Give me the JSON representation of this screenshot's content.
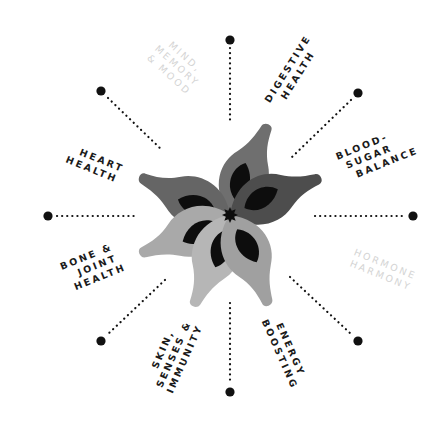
{
  "diagram": {
    "center": {
      "x": 230,
      "y": 215
    },
    "colors": {
      "background": "#ffffff",
      "spoke_dot": "#111111",
      "label_active": "#1a1a1a",
      "label_faded": "#d4d4d4",
      "petal_inner": "#0d0d0d",
      "center_star": "#0d0d0d"
    },
    "petals": [
      {
        "name": "petal-upper",
        "angle": -67,
        "color": "#6f6f6f"
      },
      {
        "name": "petal-right",
        "angle": -22,
        "color": "#4d4d4d"
      },
      {
        "name": "petal-upper-left",
        "angle": -157,
        "color": "#656565"
      },
      {
        "name": "petal-lower-left",
        "angle": 157,
        "color": "#a9a9a9"
      },
      {
        "name": "petal-lower",
        "angle": 112,
        "color": "#b6b6b6"
      },
      {
        "name": "petal-lower-right",
        "angle": 67,
        "color": "#a0a0a0"
      }
    ],
    "spokes": [
      {
        "name": "spoke-top",
        "x1": 230,
        "y1": 48,
        "x2": 230,
        "y2": 122,
        "dot_x": 230,
        "dot_y": 40
      },
      {
        "name": "spoke-top-right",
        "x1": 351,
        "y1": 100,
        "x2": 292,
        "y2": 157,
        "dot_x": 358,
        "dot_y": 93
      },
      {
        "name": "spoke-right",
        "x1": 315,
        "y1": 216,
        "x2": 405,
        "y2": 216,
        "dot_x": 413,
        "dot_y": 216
      },
      {
        "name": "spoke-bottom-right",
        "x1": 290,
        "y1": 277,
        "x2": 351,
        "y2": 334,
        "dot_x": 358,
        "dot_y": 341
      },
      {
        "name": "spoke-bottom",
        "x1": 230,
        "y1": 303,
        "x2": 230,
        "y2": 384,
        "dot_x": 230,
        "dot_y": 392
      },
      {
        "name": "spoke-bottom-left",
        "x1": 165,
        "y1": 280,
        "x2": 108,
        "y2": 334,
        "dot_x": 101,
        "dot_y": 341
      },
      {
        "name": "spoke-left",
        "x1": 57,
        "y1": 216,
        "x2": 136,
        "y2": 216,
        "dot_x": 48,
        "dot_y": 216
      },
      {
        "name": "spoke-top-left",
        "x1": 108,
        "y1": 98,
        "x2": 163,
        "y2": 151,
        "dot_x": 101,
        "dot_y": 91
      }
    ],
    "labels": [
      {
        "name": "label-mind-memory-mood",
        "lines": [
          "MIND,",
          "MEMORY",
          "& MOOD"
        ],
        "faded": true
      },
      {
        "name": "label-digestive-health",
        "lines": [
          "DIGESTIVE",
          "HEALTH"
        ],
        "faded": false
      },
      {
        "name": "label-blood-sugar-balance",
        "lines": [
          "BLOOD-",
          "SUGAR",
          "BALANCE"
        ],
        "faded": false
      },
      {
        "name": "label-hormone-harmony",
        "lines": [
          "HORMONE",
          "HARMONY"
        ],
        "faded": true
      },
      {
        "name": "label-energy-boosting",
        "lines": [
          "ENERGY",
          "BOOSTING"
        ],
        "faded": false
      },
      {
        "name": "label-skin-senses-immunity",
        "lines": [
          "SKIN,",
          "SENSES &",
          "IMMUNITY"
        ],
        "faded": false
      },
      {
        "name": "label-bone-joint-health",
        "lines": [
          "BONE &",
          "JOINT",
          "HEALTH"
        ],
        "faded": false
      },
      {
        "name": "label-heart-health",
        "lines": [
          "HEART",
          "HEALTH"
        ],
        "faded": false
      }
    ]
  }
}
